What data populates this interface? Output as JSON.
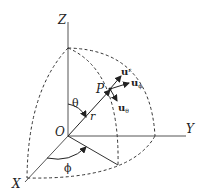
{
  "diagram": {
    "axes": {
      "z": "Z",
      "y": "Y",
      "x": "X"
    },
    "origin": "O",
    "point": "P",
    "radius": "r",
    "polar_angle": "θ",
    "azimuth_angle": "ϕ",
    "unit_vectors": {
      "r": {
        "base": "u",
        "sub": "r"
      },
      "phi": {
        "base": "u",
        "sub": "ϕ"
      },
      "theta": {
        "base": "u",
        "sub": "θ"
      }
    },
    "colors": {
      "ink": "#222222",
      "background": "#ffffff"
    }
  }
}
